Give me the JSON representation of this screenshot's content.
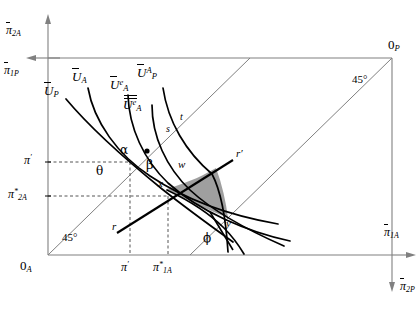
{
  "figure": {
    "type": "edgeworth-box-indifference-diagram",
    "background": "#ffffff",
    "line_color": "#000000",
    "axis_color": "#808080",
    "shade_color": "#9a9a9a"
  },
  "axes": {
    "y_top_label": "π",
    "y_top_sub": "2A",
    "y_left_label": "π",
    "y_left_sub": "1P",
    "x_right_label": "π",
    "x_right_sub": "1A",
    "x_down_label": "π",
    "x_down_sub": "2P"
  },
  "origins": {
    "bottom_left": {
      "text": "0",
      "sub": "A"
    },
    "top_right": {
      "text": "0",
      "sub": "P"
    }
  },
  "angles": {
    "lower_left": "45°",
    "upper_right": "45°"
  },
  "ticks": {
    "y": [
      {
        "label": "π",
        "mark": "′",
        "sub": ""
      },
      {
        "label": "π",
        "mark": "*",
        "sub": "2A"
      }
    ],
    "x": [
      {
        "label": "π",
        "mark": "′",
        "sub": ""
      },
      {
        "label": "π",
        "mark": "*",
        "sub": "1A"
      }
    ]
  },
  "curves": [
    {
      "id": "U_P",
      "label": "U",
      "accent": "bar",
      "sup": "",
      "sub": "P"
    },
    {
      "id": "U_A",
      "label": "U",
      "accent": "bar",
      "sup": "",
      "sub": "A"
    },
    {
      "id": "Ue_A",
      "label": "U",
      "accent": "bar",
      "sup": "e",
      "sub": "A"
    },
    {
      "id": "UA_P",
      "label": "U",
      "accent": "bar",
      "sup": "A",
      "sub": "P"
    },
    {
      "id": "Uee_A",
      "label": "U",
      "accent": "dbar",
      "sup": "e",
      "sub": "A"
    }
  ],
  "points": [
    {
      "id": "alpha",
      "text": "α"
    },
    {
      "id": "beta",
      "text": "β"
    },
    {
      "id": "theta",
      "text": "θ"
    },
    {
      "id": "phi",
      "text": "ϕ"
    },
    {
      "id": "s",
      "text": "s"
    },
    {
      "id": "t",
      "text": "t"
    },
    {
      "id": "w",
      "text": "w"
    },
    {
      "id": "x",
      "text": "x"
    },
    {
      "id": "y",
      "text": "y"
    },
    {
      "id": "r",
      "text": "r"
    },
    {
      "id": "r_prime",
      "text": "r′"
    }
  ],
  "shaded_region": {
    "name": "lens",
    "vertices": [
      "x",
      "w",
      "y"
    ],
    "fill": "#9a9a9a"
  }
}
